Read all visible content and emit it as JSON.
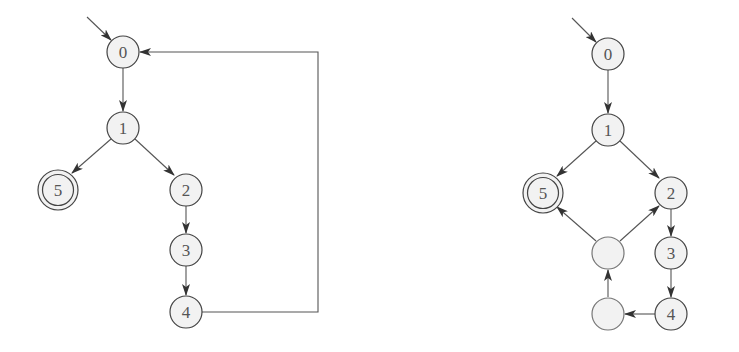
{
  "diagrams": [
    {
      "name": "left-automaton",
      "initial_state": "0",
      "accepting_states": [
        "5"
      ],
      "nodes": [
        {
          "id": "n0",
          "label": "0",
          "x": 123,
          "y": 52,
          "accepting": false
        },
        {
          "id": "n1",
          "label": "1",
          "x": 123,
          "y": 128,
          "accepting": false
        },
        {
          "id": "n5",
          "label": "5",
          "x": 58,
          "y": 190,
          "accepting": true
        },
        {
          "id": "n2",
          "label": "2",
          "x": 186,
          "y": 190,
          "accepting": false
        },
        {
          "id": "n3",
          "label": "3",
          "x": 186,
          "y": 250,
          "accepting": false
        },
        {
          "id": "n4",
          "label": "4",
          "x": 186,
          "y": 312,
          "accepting": false
        }
      ],
      "edges": [
        {
          "from": "start",
          "to": "0"
        },
        {
          "from": "0",
          "to": "1"
        },
        {
          "from": "1",
          "to": "5"
        },
        {
          "from": "1",
          "to": "2"
        },
        {
          "from": "2",
          "to": "3"
        },
        {
          "from": "3",
          "to": "4"
        },
        {
          "from": "4",
          "to": "0",
          "route": "right-loop"
        }
      ]
    },
    {
      "name": "right-automaton",
      "initial_state": "0",
      "accepting_states": [
        "5"
      ],
      "nodes": [
        {
          "id": "m0",
          "label": "0",
          "x": 608,
          "y": 54,
          "accepting": false
        },
        {
          "id": "m1",
          "label": "1",
          "x": 608,
          "y": 130,
          "accepting": false
        },
        {
          "id": "m5",
          "label": "5",
          "x": 543,
          "y": 193,
          "accepting": true
        },
        {
          "id": "m2",
          "label": "2",
          "x": 671,
          "y": 193,
          "accepting": false
        },
        {
          "id": "m3",
          "label": "3",
          "x": 671,
          "y": 253,
          "accepting": false
        },
        {
          "id": "m4",
          "label": "4",
          "x": 671,
          "y": 314,
          "accepting": false
        },
        {
          "id": "mA",
          "label": "",
          "x": 608,
          "y": 253,
          "accepting": false
        },
        {
          "id": "mB",
          "label": "",
          "x": 608,
          "y": 314,
          "accepting": false
        }
      ],
      "edges": [
        {
          "from": "start",
          "to": "0"
        },
        {
          "from": "0",
          "to": "1"
        },
        {
          "from": "1",
          "to": "5"
        },
        {
          "from": "1",
          "to": "2"
        },
        {
          "from": "2",
          "to": "3"
        },
        {
          "from": "3",
          "to": "4"
        },
        {
          "from": "4",
          "to": "unlabeled-lower"
        },
        {
          "from": "unlabeled-lower",
          "to": "unlabeled-upper"
        },
        {
          "from": "unlabeled-upper",
          "to": "5"
        },
        {
          "from": "unlabeled-upper",
          "to": "2"
        }
      ]
    }
  ],
  "labels": {
    "left": {
      "n0": "0",
      "n1": "1",
      "n2": "2",
      "n3": "3",
      "n4": "4",
      "n5": "5"
    },
    "right": {
      "m0": "0",
      "m1": "1",
      "m2": "2",
      "m3": "3",
      "m4": "4",
      "m5": "5",
      "mA": "",
      "mB": ""
    }
  },
  "colors": {
    "node_fill": "#f2f2f2",
    "stroke": "#444444",
    "text": "#555555",
    "background": "#ffffff"
  }
}
